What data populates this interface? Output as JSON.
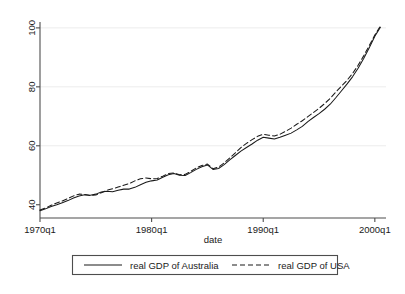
{
  "chart_data": {
    "type": "line",
    "title": "",
    "xlabel": "date",
    "ylabel": "",
    "xlim": [
      1970.0,
      2001.0
    ],
    "ylim": [
      35.5,
      102.0
    ],
    "grid": true,
    "grid_axis": "y",
    "legend_position": "bottom",
    "xticks": [
      "1970q1",
      "1980q1",
      "1990q1",
      "2000q1"
    ],
    "xtick_values": [
      1970,
      1980,
      1990,
      2000
    ],
    "yticks": [
      "40",
      "60",
      "80",
      "100"
    ],
    "ytick_values": [
      40,
      60,
      80,
      100
    ],
    "x": [
      1970.0,
      1970.5,
      1971.0,
      1971.5,
      1972.0,
      1972.5,
      1973.0,
      1973.5,
      1974.0,
      1974.5,
      1975.0,
      1975.5,
      1976.0,
      1976.5,
      1977.0,
      1977.5,
      1978.0,
      1978.5,
      1979.0,
      1979.5,
      1980.0,
      1980.5,
      1981.0,
      1981.5,
      1982.0,
      1982.5,
      1983.0,
      1983.5,
      1984.0,
      1984.5,
      1985.0,
      1985.5,
      1986.0,
      1986.5,
      1987.0,
      1987.5,
      1988.0,
      1988.5,
      1989.0,
      1989.5,
      1990.0,
      1990.5,
      1991.0,
      1991.5,
      1992.0,
      1992.5,
      1993.0,
      1993.5,
      1994.0,
      1994.5,
      1995.0,
      1995.5,
      1996.0,
      1996.5,
      1997.0,
      1997.5,
      1998.0,
      1998.5,
      1999.0,
      1999.5,
      2000.0,
      2000.5
    ],
    "series": [
      {
        "name": "real GDP of Australia",
        "style": "solid",
        "color": "#1a1a1a",
        "values": [
          38.0,
          38.6,
          39.4,
          40.0,
          40.7,
          41.4,
          42.3,
          43.0,
          43.4,
          43.2,
          43.6,
          44.3,
          44.6,
          44.4,
          44.9,
          45.3,
          45.3,
          45.9,
          46.8,
          47.6,
          48.1,
          48.4,
          49.3,
          50.2,
          50.6,
          50.0,
          49.9,
          50.9,
          52.0,
          52.9,
          53.5,
          52.0,
          52.3,
          53.6,
          55.2,
          56.7,
          58.2,
          59.4,
          60.6,
          61.9,
          62.9,
          62.6,
          62.3,
          62.9,
          63.6,
          64.3,
          65.4,
          66.6,
          68.2,
          69.6,
          70.9,
          72.4,
          74.1,
          76.3,
          78.6,
          80.9,
          83.4,
          86.3,
          89.6,
          93.3,
          97.2,
          100.2
        ]
      },
      {
        "name": "real GDP of USA",
        "style": "dashed",
        "color": "#1a1a1a",
        "values": [
          38.2,
          38.9,
          39.8,
          40.6,
          41.3,
          42.1,
          43.0,
          43.6,
          43.5,
          43.1,
          43.3,
          44.1,
          44.9,
          45.4,
          46.0,
          46.6,
          47.2,
          48.1,
          48.8,
          49.1,
          48.8,
          48.9,
          49.7,
          50.6,
          50.8,
          50.2,
          50.3,
          51.3,
          52.5,
          53.3,
          53.8,
          52.2,
          52.8,
          54.2,
          55.9,
          57.6,
          59.4,
          60.8,
          62.1,
          63.2,
          63.9,
          63.6,
          63.3,
          63.9,
          64.9,
          66.0,
          67.3,
          68.5,
          69.9,
          71.3,
          72.7,
          74.3,
          76.1,
          78.2,
          80.2,
          82.2,
          84.5,
          87.3,
          90.5,
          94.0,
          97.6,
          100.6
        ]
      }
    ],
    "legend": [
      {
        "label": "real GDP of Australia",
        "style": "solid"
      },
      {
        "label": "real GDP of USA",
        "style": "dashed"
      }
    ]
  },
  "colors": {
    "background": "#ffffff",
    "axis": "#4d4d4d",
    "text": "#1a1a1a",
    "grid": "#ececec",
    "line": "#1a1a1a"
  }
}
